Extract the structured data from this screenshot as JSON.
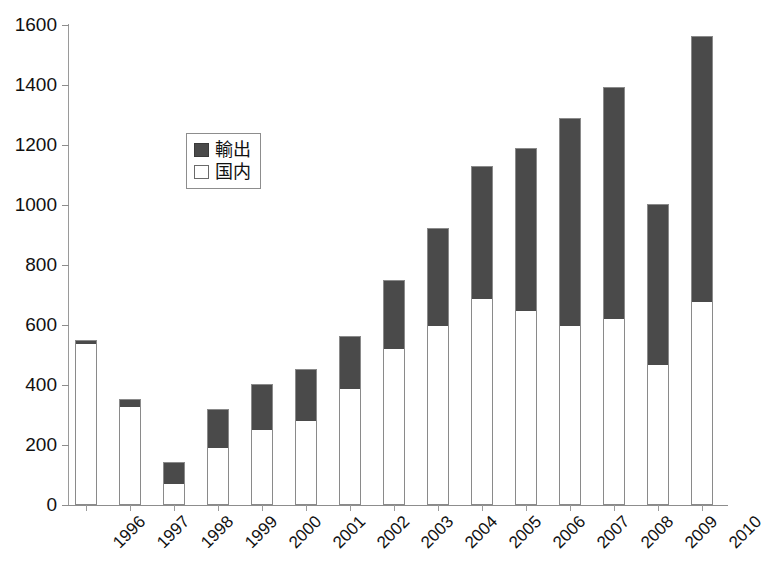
{
  "chart_data": {
    "type": "bar",
    "subtype": "stacked-vertical",
    "title": "",
    "xlabel": "",
    "ylabel": "",
    "ylim": [
      0,
      1600
    ],
    "ytick_step": 200,
    "yticks": [
      0,
      200,
      400,
      600,
      800,
      1000,
      1200,
      1400,
      1600
    ],
    "grid": false,
    "legend_position": "inside-upper-left",
    "categories": [
      "1996",
      "1997",
      "1998",
      "1999",
      "2000",
      "2001",
      "2002",
      "2003",
      "2004",
      "2005",
      "2006",
      "2007",
      "2008",
      "2009",
      "2010"
    ],
    "series": [
      {
        "name": "国内",
        "key": "domestic",
        "color": "#ffffff",
        "stack_order": 0,
        "values": [
          540,
          330,
          75,
          195,
          255,
          285,
          390,
          525,
          600,
          690,
          650,
          600,
          625,
          470,
          680
        ]
      },
      {
        "name": "輸出",
        "key": "export",
        "color": "#4a4a4a",
        "stack_order": 1,
        "values": [
          10,
          25,
          70,
          125,
          150,
          170,
          175,
          225,
          325,
          440,
          540,
          690,
          770,
          535,
          885
        ]
      }
    ],
    "totals": [
      550,
      355,
      145,
      320,
      405,
      455,
      565,
      750,
      925,
      1130,
      1190,
      1290,
      1395,
      1005,
      1565
    ]
  },
  "legend": {
    "items": [
      {
        "label": "輸出",
        "swatch": "dark"
      },
      {
        "label": "国内",
        "swatch": "light"
      }
    ]
  },
  "axes": {
    "y_tick_labels": [
      "1600",
      "1400",
      "1200",
      "1000",
      "800",
      "600",
      "400",
      "200",
      "0"
    ],
    "x_tick_labels": [
      "1996",
      "1997",
      "1998",
      "1999",
      "2000",
      "2001",
      "2002",
      "2003",
      "2004",
      "2005",
      "2006",
      "2007",
      "2008",
      "2009",
      "2010"
    ]
  },
  "colors": {
    "export_fill": "#4a4a4a",
    "domestic_fill": "#ffffff",
    "bar_outline": "#8a8a8a",
    "axis": "#8d8d8d",
    "text": "#111111"
  }
}
